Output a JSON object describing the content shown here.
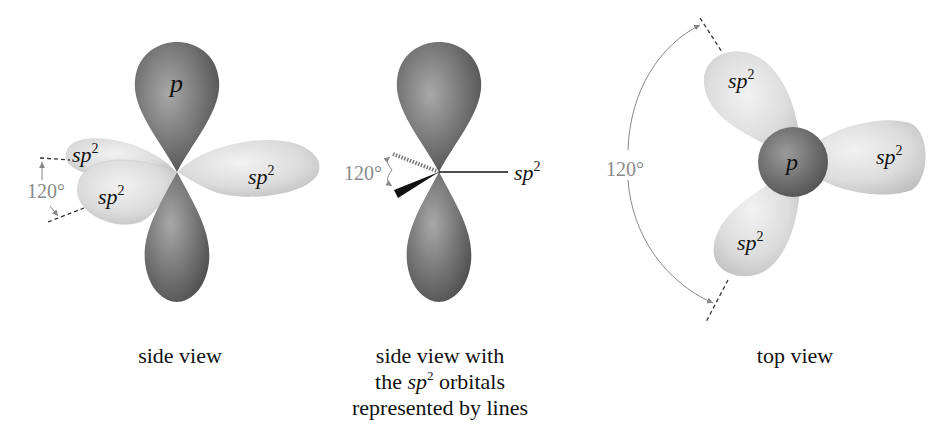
{
  "colors": {
    "p_orbital": "#6f6f6f",
    "sp2_orbital": "#d7d7d7",
    "angle_label": "#8a8a8a",
    "text": "#111111"
  },
  "panels": [
    {
      "id": "side-view",
      "caption": "side view",
      "labels": {
        "p": "p",
        "sp2_a": "sp",
        "sp2_b": "sp",
        "sp2_c": "sp",
        "sup": "2",
        "angle": "120°"
      }
    },
    {
      "id": "side-view-lines",
      "caption_lines": [
        "side view with",
        "the",
        "sp",
        "2",
        "orbitals",
        "represented by lines"
      ],
      "labels": {
        "sp2": "sp",
        "sup": "2",
        "angle": "120°"
      }
    },
    {
      "id": "top-view",
      "caption": "top view",
      "labels": {
        "p": "p",
        "sp2_a": "sp",
        "sp2_b": "sp",
        "sp2_c": "sp",
        "sup": "2",
        "angle": "120°"
      }
    }
  ]
}
